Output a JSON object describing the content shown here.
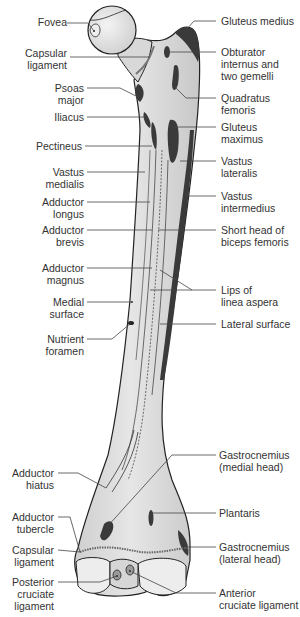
{
  "diagram": {
    "colors": {
      "bone_fill": "#d9d9d9",
      "bone_light": "#eeeeee",
      "outline": "#222222",
      "muscle_attachment": "#3a3a3a",
      "label_text": "#333333",
      "leader_line": "#444444"
    },
    "labels_left": [
      {
        "id": "fovea",
        "lines": [
          "Fovea"
        ]
      },
      {
        "id": "capsular-ligament-top",
        "lines": [
          "Capsular",
          "ligament"
        ]
      },
      {
        "id": "psoas-major",
        "lines": [
          "Psoas",
          "major"
        ]
      },
      {
        "id": "iliacus",
        "lines": [
          "Iliacus"
        ]
      },
      {
        "id": "pectineus",
        "lines": [
          "Pectineus"
        ]
      },
      {
        "id": "vastus-medialis",
        "lines": [
          "Vastus",
          "medialis"
        ]
      },
      {
        "id": "adductor-longus",
        "lines": [
          "Adductor",
          "longus"
        ]
      },
      {
        "id": "adductor-brevis",
        "lines": [
          "Adductor",
          "brevis"
        ]
      },
      {
        "id": "adductor-magnus",
        "lines": [
          "Adductor",
          "magnus"
        ]
      },
      {
        "id": "medial-surface",
        "lines": [
          "Medial",
          "surface"
        ]
      },
      {
        "id": "nutrient-foramen",
        "lines": [
          "Nutrient",
          "foramen"
        ]
      },
      {
        "id": "adductor-hiatus",
        "lines": [
          "Adductor",
          "hiatus"
        ]
      },
      {
        "id": "adductor-tubercle",
        "lines": [
          "Adductor",
          "tubercle"
        ]
      },
      {
        "id": "capsular-ligament-bottom",
        "lines": [
          "Capsular",
          "ligament"
        ]
      },
      {
        "id": "posterior-cruciate-ligament",
        "lines": [
          "Posterior",
          "cruciate",
          "ligament"
        ]
      }
    ],
    "labels_right": [
      {
        "id": "gluteus-medius",
        "lines": [
          "Gluteus medius"
        ]
      },
      {
        "id": "obturator-internus",
        "lines": [
          "Obturator",
          "internus and",
          "two gemelli"
        ]
      },
      {
        "id": "quadratus-femoris",
        "lines": [
          "Quadratus",
          "femoris"
        ]
      },
      {
        "id": "gluteus-maximus",
        "lines": [
          "Gluteus",
          "maximus"
        ]
      },
      {
        "id": "vastus-lateralis",
        "lines": [
          "Vastus",
          "lateralis"
        ]
      },
      {
        "id": "vastus-intermedius",
        "lines": [
          "Vastus",
          "intermedius"
        ]
      },
      {
        "id": "short-head-biceps",
        "lines": [
          "Short head of",
          "biceps femoris"
        ]
      },
      {
        "id": "lips-linea-aspera",
        "lines": [
          "Lips of",
          "linea aspera"
        ]
      },
      {
        "id": "lateral-surface",
        "lines": [
          "Lateral surface"
        ]
      },
      {
        "id": "gastrocnemius-medial",
        "lines": [
          "Gastrocnemius",
          "(medial head)"
        ]
      },
      {
        "id": "plantaris",
        "lines": [
          "Plantaris"
        ]
      },
      {
        "id": "gastrocnemius-lateral",
        "lines": [
          "Gastrocnemius",
          "(lateral head)"
        ]
      },
      {
        "id": "anterior-cruciate-ligament",
        "lines": [
          "Anterior",
          "cruciate ligament"
        ]
      }
    ]
  }
}
